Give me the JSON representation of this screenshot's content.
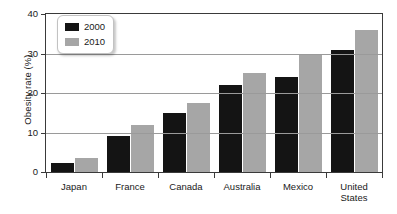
{
  "chart_data": {
    "type": "bar",
    "title": "",
    "xlabel": "",
    "ylabel": "Obesity rate (%)",
    "categories": [
      "Japan",
      "France",
      "Canada",
      "Australia",
      "Mexico",
      "United States"
    ],
    "series": [
      {
        "name": "2000",
        "color": "#141414",
        "values": [
          2.3,
          9,
          15,
          22,
          24,
          31
        ]
      },
      {
        "name": "2010",
        "color": "#a6a6a6",
        "values": [
          3.5,
          12,
          17.5,
          25,
          30,
          36
        ]
      }
    ],
    "ylim": [
      0,
      40
    ],
    "yticks": [
      0,
      10,
      20,
      30,
      40
    ],
    "ytick_labels": [
      "0",
      "10",
      "20",
      "30",
      "40"
    ],
    "grid": true,
    "legend_position": "top-left",
    "legend_entries": [
      "2000",
      "2010"
    ]
  }
}
